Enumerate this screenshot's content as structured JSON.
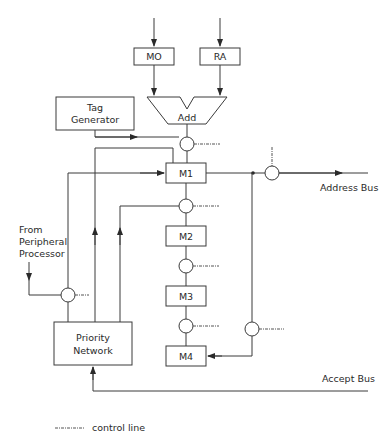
{
  "diagram": {
    "type": "block-diagram",
    "blocks": {
      "mo": "MO",
      "ra": "RA",
      "add": "Add",
      "tag_generator_line1": "Tag",
      "tag_generator_line2": "Generator",
      "m1": "M1",
      "m2": "M2",
      "m3": "M3",
      "m4": "M4",
      "priority_network_line1": "Priority",
      "priority_network_line2": "Network"
    },
    "labels": {
      "address_bus": "Address Bus",
      "accept_bus": "Accept Bus",
      "from_peripheral_line1": "From",
      "from_peripheral_line2": "Peripheral",
      "from_peripheral_line3": "Processor"
    },
    "legend": {
      "control_line": "control line"
    },
    "colors": {
      "stroke": "#3a3a3a",
      "background": "#ffffff"
    }
  }
}
